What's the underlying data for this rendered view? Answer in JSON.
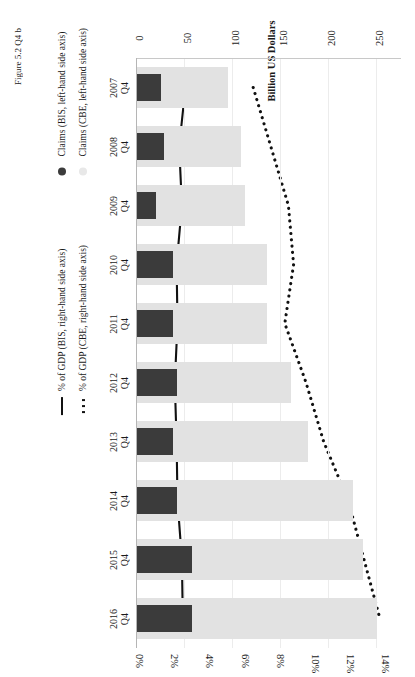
{
  "chart_data": {
    "type": "bar",
    "title": "",
    "orientation": "vertical-bars-rotated",
    "categories": [
      "Q4\n2007",
      "Q4\n2008",
      "Q4\n2009",
      "Q4\n2010",
      "Q4\n2011",
      "Q4\n2012",
      "Q4\n2013",
      "Q4\n2014",
      "Q4\n2015",
      "Q4\n2016"
    ],
    "category_lines": [
      {
        "q": "Q4",
        "y": "2007"
      },
      {
        "q": "Q4",
        "y": "2008"
      },
      {
        "q": "Q4",
        "y": "2009"
      },
      {
        "q": "Q4",
        "y": "2010"
      },
      {
        "q": "Q4",
        "y": "2011"
      },
      {
        "q": "Q4",
        "y": "2012"
      },
      {
        "q": "Q4",
        "y": "2013"
      },
      {
        "q": "Q4",
        "y": "2014"
      },
      {
        "q": "Q4",
        "y": "2015"
      },
      {
        "q": "Q4",
        "y": "2016"
      }
    ],
    "ylabel": "Billion US Dollars",
    "ylim": [
      0,
      275
    ],
    "yticks": [
      0,
      50,
      100,
      150,
      200,
      250
    ],
    "ytick_labels": [
      "0",
      "50",
      "100",
      "150",
      "200",
      "250"
    ],
    "y2label": "",
    "y2lim": [
      0,
      15
    ],
    "y2ticks": [
      0,
      2,
      4,
      6,
      8,
      10,
      12,
      14
    ],
    "y2tick_labels": [
      "0%",
      "2%",
      "4%",
      "6%",
      "8%",
      "10%",
      "12%",
      "14%"
    ],
    "grid": true,
    "legend_position": "right",
    "series": [
      {
        "name": "Claims (BIS, left-hand side axis)",
        "type": "bar",
        "axis": "left",
        "color": "#3b3b3b",
        "legend_marker": "filled-circle-dark",
        "values": [
          25,
          28,
          20,
          38,
          38,
          42,
          38,
          42,
          57,
          57
        ]
      },
      {
        "name": "Claims (CBE, left-hand side axis)",
        "type": "bar",
        "axis": "left",
        "color": "#e2e2e2",
        "legend_marker": "filled-circle-light",
        "values": [
          95,
          108,
          112,
          135,
          135,
          160,
          178,
          225,
          235,
          250
        ]
      },
      {
        "name": "% of GDP (BIS, right-hand side axis)",
        "type": "line",
        "axis": "right",
        "color": "#111111",
        "style": "solid",
        "legend_marker": "solid-line",
        "values": [
          2.75,
          2.4,
          2.55,
          2.25,
          2.3,
          2.15,
          2.25,
          2.3,
          2.55,
          2.6
        ]
      },
      {
        "name": "% of GDP (CBE, right-hand side axis)",
        "type": "line",
        "axis": "right",
        "color": "#111111",
        "style": "dotted",
        "legend_marker": "dotted-line",
        "values": [
          6.6,
          7.6,
          8.6,
          8.9,
          8.4,
          9.6,
          10.6,
          12.0,
          12.9,
          13.8
        ]
      }
    ]
  },
  "legend": {
    "items": [
      {
        "label": "Claims (BIS, left-hand side axis)",
        "marker": "filled-circle-dark"
      },
      {
        "label": "Claims (CBE, left-hand side axis)",
        "marker": "filled-circle-light"
      },
      {
        "label": "% of GDP (BIS, right-hand side axis)",
        "marker": "solid-line"
      },
      {
        "label": "% of GDP (CBE, right-hand side axis)",
        "marker": "dotted-line"
      }
    ]
  },
  "caption": {
    "text": "Figure 5.2  Q4 b"
  }
}
